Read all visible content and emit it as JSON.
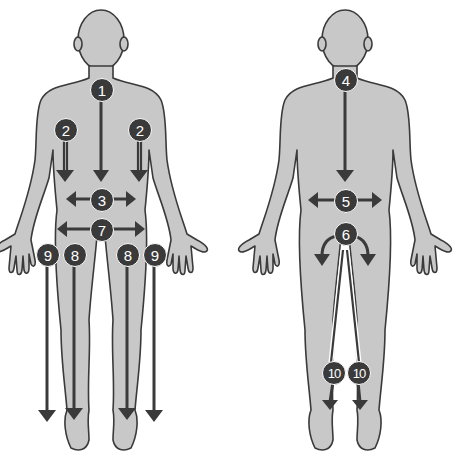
{
  "diagram": {
    "title": "",
    "colors": {
      "body": "#c8c8c8",
      "outline": "#3a3a3a",
      "marker": "#3a3a3a",
      "marker_text": "#ffffff"
    },
    "front_view": {
      "markers": [
        {
          "id": "m1",
          "label": "1",
          "x": 101,
          "y": 89
        },
        {
          "id": "m2a",
          "label": "2",
          "x": 65,
          "y": 129
        },
        {
          "id": "m2b",
          "label": "2",
          "x": 139,
          "y": 129
        },
        {
          "id": "m3",
          "label": "3",
          "x": 101,
          "y": 199
        },
        {
          "id": "m7",
          "label": "7",
          "x": 101,
          "y": 229
        },
        {
          "id": "m9a",
          "label": "9",
          "x": 47,
          "y": 254
        },
        {
          "id": "m8a",
          "label": "8",
          "x": 74,
          "y": 254
        },
        {
          "id": "m8b",
          "label": "8",
          "x": 127,
          "y": 254
        },
        {
          "id": "m9b",
          "label": "9",
          "x": 154,
          "y": 254
        }
      ]
    },
    "back_view": {
      "markers": [
        {
          "id": "m4",
          "label": "4",
          "x": 345,
          "y": 79
        },
        {
          "id": "m5",
          "label": "5",
          "x": 345,
          "y": 200
        },
        {
          "id": "m6",
          "label": "6",
          "x": 345,
          "y": 233
        },
        {
          "id": "m10a",
          "label": "10",
          "x": 333,
          "y": 372
        },
        {
          "id": "m10b",
          "label": "10",
          "x": 358,
          "y": 372
        }
      ]
    }
  }
}
